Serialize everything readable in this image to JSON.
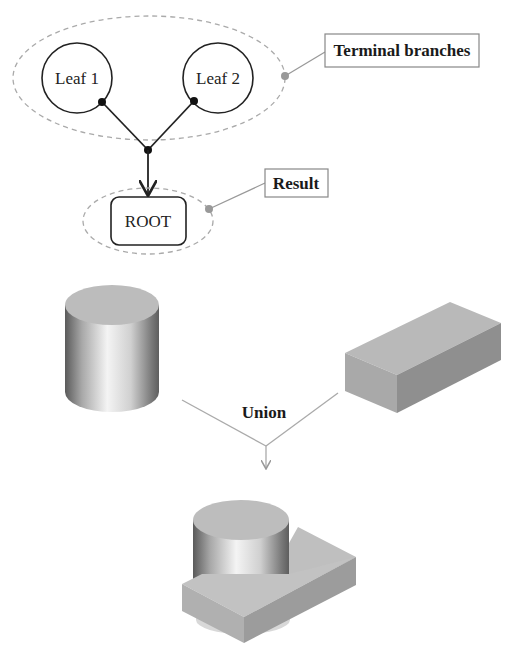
{
  "tree": {
    "leaf1": {
      "label": "Leaf 1"
    },
    "leaf2": {
      "label": "Leaf 2"
    },
    "root": {
      "label": "ROOT"
    }
  },
  "callouts": {
    "terminal": {
      "label": "Terminal branches"
    },
    "result": {
      "label": "Result"
    }
  },
  "operation": {
    "label": "Union"
  },
  "shapes": {
    "input_a": "cylinder",
    "input_b": "box",
    "output": "cylinder-union-box"
  },
  "colors": {
    "line": "#222222",
    "dashed": "#aaaaaa",
    "callout_line": "#999999",
    "callout_box": "#888888",
    "solid_face": "#bdbdbd",
    "solid_dark": "#9a9a9a"
  }
}
